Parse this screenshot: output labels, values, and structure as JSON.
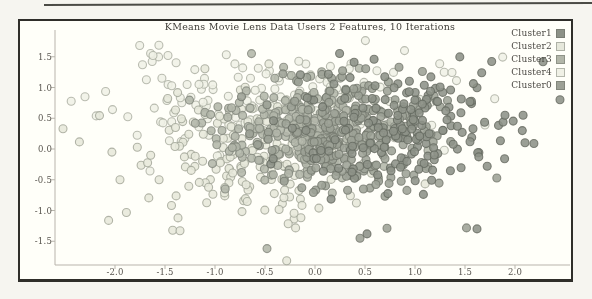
{
  "page": {
    "background": "#f6f5f0",
    "frame_border_color": "#2e2e2a",
    "artifact_line_color": "#4a4a46"
  },
  "chart_data": {
    "type": "scatter",
    "title": "KMeans Movie Lens Data Users 2 Features, 10 Iterations",
    "xlabel": "",
    "ylabel": "",
    "xlim": [
      -2.6,
      2.55
    ],
    "ylim": [
      -1.89,
      1.93
    ],
    "grid": false,
    "legend_position": "upper right",
    "x_ticks": [
      "-2.0",
      "-1.5",
      "-1.0",
      "-0.5",
      "0.0",
      "0.5",
      "1.0",
      "1.5",
      "2.0"
    ],
    "y_ticks": [
      "1.5",
      "1.0",
      "0.5",
      "0.0",
      "-0.5",
      "-1.0",
      "-1.5"
    ],
    "axis_mapping": {
      "x0_px": 315,
      "px_per_x": 100,
      "y0_px": 149,
      "px_per_y": 61.5
    },
    "spine_color": "#b4b3ac",
    "marker": {
      "size_px": 8,
      "edge_width": 1.1,
      "fill_opacity": 0.88,
      "edge_opacity": 0.78
    },
    "legend": [
      {
        "label": "Cluster1",
        "color": "#8a9187"
      },
      {
        "label": "Cluster2",
        "color": "#e2e6da"
      },
      {
        "label": "Cluster3",
        "color": "#aeb5a8"
      },
      {
        "label": "Cluster4",
        "color": "#ecefe6"
      },
      {
        "label": "Cluster0",
        "color": "#9aa095"
      }
    ],
    "draw_order": [
      "Cluster4",
      "Cluster2",
      "Cluster3",
      "Cluster0",
      "Cluster1"
    ],
    "clusters": [
      {
        "name": "Cluster4",
        "fill": "#ecefe6",
        "edge": "#a3a99e",
        "center": [
          -0.5,
          0.78
        ],
        "std": [
          0.82,
          0.4
        ],
        "count": 150,
        "seed": 11
      },
      {
        "name": "Cluster2",
        "fill": "#e2e6da",
        "edge": "#9aa092",
        "center": [
          -0.78,
          -0.08
        ],
        "std": [
          0.6,
          0.52
        ],
        "count": 165,
        "seed": 22
      },
      {
        "name": "Cluster3",
        "fill": "#aeb5a8",
        "edge": "#7e847a",
        "center": [
          -0.13,
          0.28
        ],
        "std": [
          0.44,
          0.4
        ],
        "count": 270,
        "seed": 33
      },
      {
        "name": "Cluster0",
        "fill": "#9aa095",
        "edge": "#70766c",
        "center": [
          0.38,
          0.18
        ],
        "std": [
          0.44,
          0.46
        ],
        "count": 225,
        "seed": 44
      },
      {
        "name": "Cluster1",
        "fill": "#8a9187",
        "edge": "#60665d",
        "center": [
          0.88,
          0.38
        ],
        "std": [
          0.54,
          0.5
        ],
        "count": 175,
        "seed": 55
      }
    ],
    "extra_points": [
      {
        "cluster": "Cluster2",
        "x": -2.52,
        "y": 0.33
      },
      {
        "cluster": "Cluster4",
        "x": -2.3,
        "y": 0.85
      },
      {
        "cluster": "Cluster4",
        "x": -1.62,
        "y": 1.52
      },
      {
        "cluster": "Cluster4",
        "x": -1.47,
        "y": 1.52
      },
      {
        "cluster": "Cluster2",
        "x": -1.95,
        "y": -0.5
      },
      {
        "cluster": "Cluster2",
        "x": -1.37,
        "y": -1.12
      },
      {
        "cluster": "Cluster2",
        "x": -1.35,
        "y": -1.33
      },
      {
        "cluster": "Cluster3",
        "x": -0.48,
        "y": -1.62
      },
      {
        "cluster": "Cluster0",
        "x": 0.45,
        "y": -1.45
      },
      {
        "cluster": "Cluster1",
        "x": 0.52,
        "y": -1.38
      },
      {
        "cluster": "Cluster1",
        "x": 1.62,
        "y": -1.3
      },
      {
        "cluster": "Cluster1",
        "x": 2.28,
        "y": 1.42
      },
      {
        "cluster": "Cluster1",
        "x": 2.45,
        "y": 0.8
      },
      {
        "cluster": "Cluster1",
        "x": 1.9,
        "y": 0.55
      },
      {
        "cluster": "Cluster1",
        "x": 2.1,
        "y": 0.1
      }
    ]
  }
}
